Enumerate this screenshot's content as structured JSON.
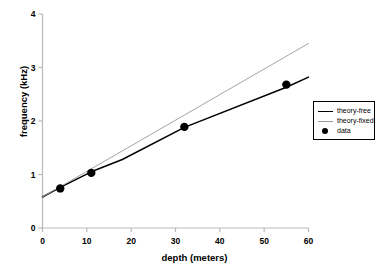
{
  "chart_data": {
    "type": "line",
    "title": "",
    "xlabel": "depth (meters)",
    "ylabel": "frequency (kHz)",
    "xlim": [
      0,
      60
    ],
    "ylim": [
      0,
      4
    ],
    "xticks": [
      "0",
      "10",
      "20",
      "30",
      "40",
      "50",
      "60"
    ],
    "yticks": [
      "0",
      "1",
      "2",
      "3",
      "4"
    ],
    "grid": false,
    "legend_position": "right",
    "series": [
      {
        "name": "theory-free",
        "type": "line",
        "color": "#000000",
        "x": [
          0,
          4,
          11,
          18,
          32,
          55,
          60
        ],
        "y": [
          0.58,
          0.76,
          1.05,
          1.28,
          1.88,
          2.63,
          2.82
        ]
      },
      {
        "name": "theory-fixed",
        "type": "line",
        "color": "#9a9a9a",
        "x": [
          0,
          60
        ],
        "y": [
          0.58,
          3.45
        ]
      },
      {
        "name": "data",
        "type": "scatter",
        "color": "#000000",
        "x": [
          4,
          11,
          32,
          55
        ],
        "y": [
          0.74,
          1.03,
          1.89,
          2.68
        ]
      }
    ]
  },
  "legend": {
    "items": [
      {
        "label": "theory-free",
        "marker": "line-black"
      },
      {
        "label": "theory-fixed",
        "marker": "line-gray"
      },
      {
        "label": "data",
        "marker": "dot-black"
      }
    ]
  }
}
